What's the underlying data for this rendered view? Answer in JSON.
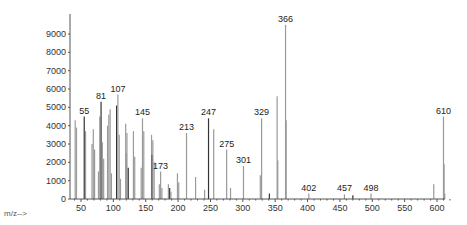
{
  "chart_data": {
    "type": "bar",
    "title": "",
    "xlabel": "m/z-->",
    "ylabel": "",
    "xlim": [
      30,
      620
    ],
    "ylim": [
      0,
      10000
    ],
    "x_ticks": [
      50,
      100,
      150,
      200,
      250,
      300,
      350,
      400,
      450,
      500,
      550,
      600
    ],
    "y_ticks": [
      0,
      1000,
      2000,
      3000,
      4000,
      5000,
      6000,
      7000,
      8000,
      9000
    ],
    "grid": false,
    "labeled_peaks": [
      {
        "mz": 55,
        "intensity": 4500
      },
      {
        "mz": 81,
        "intensity": 5300
      },
      {
        "mz": 107,
        "intensity": 5700
      },
      {
        "mz": 145,
        "intensity": 4400
      },
      {
        "mz": 173,
        "intensity": 1500
      },
      {
        "mz": 213,
        "intensity": 3600
      },
      {
        "mz": 247,
        "intensity": 4400
      },
      {
        "mz": 275,
        "intensity": 2700
      },
      {
        "mz": 301,
        "intensity": 1800
      },
      {
        "mz": 329,
        "intensity": 4400
      },
      {
        "mz": 366,
        "intensity": 9500
      },
      {
        "mz": 402,
        "intensity": 300
      },
      {
        "mz": 457,
        "intensity": 250
      },
      {
        "mz": 498,
        "intensity": 300
      },
      {
        "mz": 610,
        "intensity": 4500
      }
    ],
    "peaks": [
      {
        "mz": 41,
        "intensity": 4300
      },
      {
        "mz": 43,
        "intensity": 3900
      },
      {
        "mz": 55,
        "intensity": 4500
      },
      {
        "mz": 57,
        "intensity": 3700
      },
      {
        "mz": 67,
        "intensity": 3000
      },
      {
        "mz": 69,
        "intensity": 3800
      },
      {
        "mz": 71,
        "intensity": 2700
      },
      {
        "mz": 77,
        "intensity": 1500
      },
      {
        "mz": 79,
        "intensity": 4500
      },
      {
        "mz": 81,
        "intensity": 5300
      },
      {
        "mz": 83,
        "intensity": 3100
      },
      {
        "mz": 85,
        "intensity": 2200
      },
      {
        "mz": 91,
        "intensity": 4000
      },
      {
        "mz": 93,
        "intensity": 4600
      },
      {
        "mz": 95,
        "intensity": 4900
      },
      {
        "mz": 97,
        "intensity": 1400
      },
      {
        "mz": 105,
        "intensity": 5100
      },
      {
        "mz": 107,
        "intensity": 5700
      },
      {
        "mz": 109,
        "intensity": 3500
      },
      {
        "mz": 111,
        "intensity": 1100
      },
      {
        "mz": 119,
        "intensity": 4100
      },
      {
        "mz": 120,
        "intensity": 2500
      },
      {
        "mz": 121,
        "intensity": 3600
      },
      {
        "mz": 123,
        "intensity": 1700
      },
      {
        "mz": 131,
        "intensity": 3700
      },
      {
        "mz": 133,
        "intensity": 2300
      },
      {
        "mz": 143,
        "intensity": 1700
      },
      {
        "mz": 145,
        "intensity": 4400
      },
      {
        "mz": 147,
        "intensity": 3700
      },
      {
        "mz": 159,
        "intensity": 3500
      },
      {
        "mz": 160,
        "intensity": 2400
      },
      {
        "mz": 161,
        "intensity": 3200
      },
      {
        "mz": 163,
        "intensity": 2000
      },
      {
        "mz": 171,
        "intensity": 800
      },
      {
        "mz": 173,
        "intensity": 1500
      },
      {
        "mz": 175,
        "intensity": 600
      },
      {
        "mz": 185,
        "intensity": 800
      },
      {
        "mz": 187,
        "intensity": 600
      },
      {
        "mz": 189,
        "intensity": 400
      },
      {
        "mz": 199,
        "intensity": 1400
      },
      {
        "mz": 201,
        "intensity": 900
      },
      {
        "mz": 213,
        "intensity": 3600
      },
      {
        "mz": 227,
        "intensity": 1200
      },
      {
        "mz": 241,
        "intensity": 500
      },
      {
        "mz": 247,
        "intensity": 4400
      },
      {
        "mz": 255,
        "intensity": 3800
      },
      {
        "mz": 275,
        "intensity": 2700
      },
      {
        "mz": 281,
        "intensity": 600
      },
      {
        "mz": 301,
        "intensity": 1800
      },
      {
        "mz": 327,
        "intensity": 1300
      },
      {
        "mz": 329,
        "intensity": 4400
      },
      {
        "mz": 341,
        "intensity": 300
      },
      {
        "mz": 353,
        "intensity": 5600
      },
      {
        "mz": 354,
        "intensity": 2100
      },
      {
        "mz": 366,
        "intensity": 9500
      },
      {
        "mz": 367,
        "intensity": 4300
      },
      {
        "mz": 402,
        "intensity": 300
      },
      {
        "mz": 457,
        "intensity": 250
      },
      {
        "mz": 470,
        "intensity": 200
      },
      {
        "mz": 498,
        "intensity": 300
      },
      {
        "mz": 595,
        "intensity": 800
      },
      {
        "mz": 610,
        "intensity": 4500
      },
      {
        "mz": 611,
        "intensity": 1900
      },
      {
        "mz": 612,
        "intensity": 300
      }
    ]
  },
  "colors": {
    "bar": "#9a9a9a",
    "bar_dark": "#333333",
    "axis": "#555555",
    "text": "#222222"
  }
}
